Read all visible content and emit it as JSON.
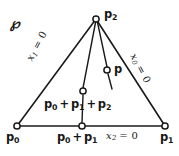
{
  "figure": {
    "region_label": "℘",
    "stroke_color": "#1a1a1a",
    "background_color": "#ffffff",
    "vertices": [
      {
        "id": "p0",
        "label": "p",
        "sub": "0",
        "x": 17,
        "y": 126
      },
      {
        "id": "p1",
        "label": "p",
        "sub": "1",
        "x": 165,
        "y": 126
      },
      {
        "id": "p2",
        "label": "p",
        "sub": "2",
        "x": 96,
        "y": 19
      }
    ],
    "markers": [
      {
        "id": "midpoint-01",
        "x": 82,
        "y": 126
      },
      {
        "id": "centroid",
        "x": 83,
        "y": 91
      },
      {
        "id": "point-p",
        "x": 107,
        "y": 70
      }
    ],
    "labels": {
      "p2": {
        "base": "p",
        "sub": "2"
      },
      "p0": {
        "base": "p",
        "sub": "0"
      },
      "p1": {
        "base": "p",
        "sub": "1"
      },
      "midpoint_sum": {
        "t0": "p",
        "s0": "0",
        "op": "+",
        "t1": "p",
        "s1": "1"
      },
      "centroid_sum": {
        "t0": "p",
        "s0": "0",
        "op1": "+",
        "t1": "p",
        "s1": "1",
        "op2": "+",
        "t2": "p",
        "s2": "2"
      },
      "point_p": "p"
    },
    "edge_equations": {
      "left": {
        "var": "x",
        "sub": "1",
        "eq": "= 0"
      },
      "right": {
        "var": "x",
        "sub": "0",
        "eq": "= 0"
      },
      "bottom": {
        "var": "x",
        "sub": "2",
        "eq": "= 0"
      }
    }
  }
}
